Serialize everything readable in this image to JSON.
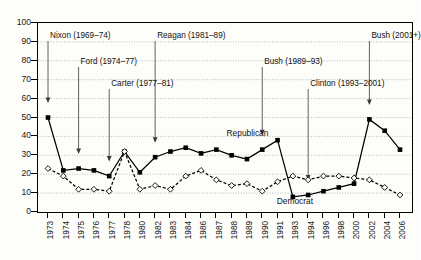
{
  "chart_data": {
    "type": "line",
    "title": "",
    "xlabel": "",
    "ylabel": "Percent a great deal",
    "ylim": [
      0,
      100
    ],
    "ytick_step": 10,
    "yticks": [
      0,
      10,
      20,
      30,
      40,
      50,
      60,
      70,
      80,
      90,
      100
    ],
    "grid": true,
    "legend_position": "inline-annotation",
    "categories": [
      "1973",
      "1974",
      "1975",
      "1976",
      "1977",
      "1978",
      "1980",
      "1982",
      "1983",
      "1984",
      "1986",
      "1987",
      "1988",
      "1989",
      "1990",
      "1991",
      "1993",
      "1994",
      "1996",
      "1998",
      "2000",
      "2002",
      "2004",
      "2006"
    ],
    "series": [
      {
        "name": "Republican",
        "marker": "filled-square",
        "line": "solid",
        "color": "#000000",
        "values": [
          50,
          22,
          23,
          22,
          19,
          32,
          21,
          29,
          32,
          34,
          31,
          33,
          30,
          28,
          33,
          38,
          8,
          9,
          11,
          13,
          15,
          49,
          43,
          33
        ]
      },
      {
        "name": "Democrat",
        "marker": "open-diamond",
        "line": "dashed",
        "color": "#000000",
        "values": [
          23,
          19,
          12,
          12,
          11,
          32,
          12,
          14,
          12,
          19,
          22,
          17,
          14,
          15,
          11,
          16,
          19,
          17,
          19,
          19,
          18,
          17,
          13,
          9
        ]
      }
    ],
    "annotations": [
      {
        "label": "Nixon (1969–74)",
        "x_category": "1973",
        "label_row": 0
      },
      {
        "label": "Ford (1974–77)",
        "x_category": "1975",
        "label_row": 1
      },
      {
        "label": "Carter (1977–81)",
        "x_category": "1977",
        "label_row": 2
      },
      {
        "label": "Reagan (1981–89)",
        "x_category": "1982",
        "label_row": 0
      },
      {
        "label": "Bush (1989–93)",
        "x_category": "1990",
        "label_row": 1
      },
      {
        "label": "Clinton (1993–2001)",
        "x_category": "1994",
        "label_row": 2
      },
      {
        "label": "Bush (2001+)",
        "x_category": "2002",
        "label_row": 0
      }
    ],
    "series_labels": [
      {
        "text": "Republican",
        "value_x": 13.1,
        "value_y": 41.5
      },
      {
        "text": "Democrat",
        "value_x": 16.2,
        "value_y": 5.5
      }
    ]
  }
}
